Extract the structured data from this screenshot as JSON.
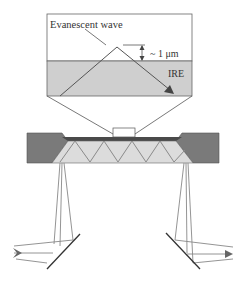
{
  "diagram": {
    "inset": {
      "evanescent_label": "Evanescent wave",
      "depth_label": "~ 1 μm",
      "crystal_label": "IRE"
    },
    "colors": {
      "ire_fill": "#cfcfcf",
      "holder_fill": "#7a7a7a",
      "crystal_top_strip": "#4a4a4a",
      "crystal_fill": "#dcdcdc",
      "beam_line": "#777777",
      "outline": "#555555"
    },
    "crystal": {
      "internal_reflections": 7
    }
  }
}
